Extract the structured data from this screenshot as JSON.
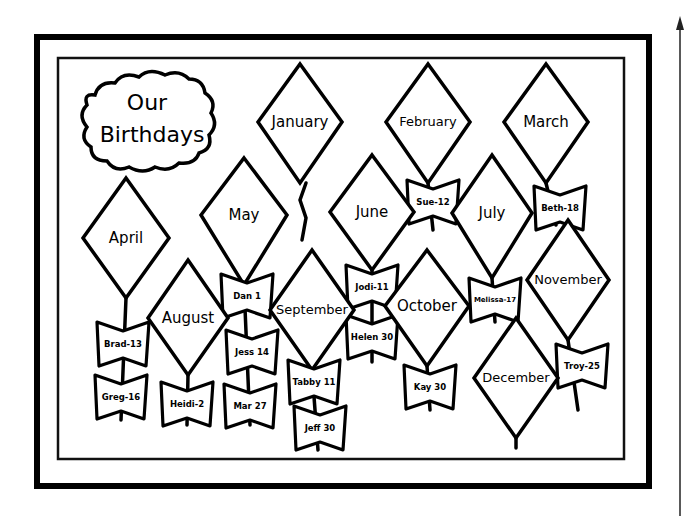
{
  "title": {
    "line1": "Our",
    "line2": "Birthdays"
  },
  "months": [
    {
      "name": "January",
      "birthdays": []
    },
    {
      "name": "February",
      "birthdays": [
        "Sue-12"
      ]
    },
    {
      "name": "March",
      "birthdays": [
        "Beth-18"
      ]
    },
    {
      "name": "April",
      "birthdays": [
        "Brad-13",
        "Greg-16"
      ]
    },
    {
      "name": "May",
      "birthdays": [
        "Dan 1",
        "Jess 14",
        "Mar 27"
      ]
    },
    {
      "name": "June",
      "birthdays": [
        "Jodi-11",
        "Helen 30"
      ]
    },
    {
      "name": "July",
      "birthdays": [
        "Melissa-17"
      ]
    },
    {
      "name": "August",
      "birthdays": [
        "Heidi-2"
      ]
    },
    {
      "name": "September",
      "birthdays": [
        "Tabby 11",
        "Jeff 30"
      ]
    },
    {
      "name": "October",
      "birthdays": [
        "Kay 30"
      ]
    },
    {
      "name": "November",
      "birthdays": [
        "Troy-25"
      ]
    },
    {
      "name": "December",
      "birthdays": []
    }
  ]
}
